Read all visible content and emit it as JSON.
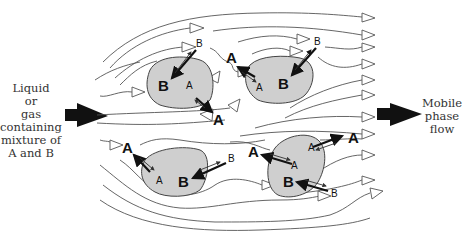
{
  "diagram": {
    "input_label": [
      "Liquid",
      "or",
      "gas",
      "containing",
      "mixture of",
      "A and B"
    ],
    "output_label": [
      "Mobile",
      "phase",
      "flow"
    ],
    "particles": [
      {
        "id": "top-left",
        "large_label": "B",
        "small_label": "A",
        "outside": [
          {
            "label": "B",
            "size": "small"
          },
          {
            "label": "A",
            "size": "large"
          }
        ]
      },
      {
        "id": "top-right",
        "large_label": "B",
        "small_label": "A",
        "outside": [
          {
            "label": "B",
            "size": "small"
          },
          {
            "label": "A",
            "size": "large"
          }
        ]
      },
      {
        "id": "bottom-left",
        "large_label": "B",
        "small_label": "A",
        "outside": [
          {
            "label": "A",
            "size": "large"
          },
          {
            "label": "B",
            "size": "small"
          }
        ]
      },
      {
        "id": "bottom-right",
        "large_label": "B",
        "small_label": "A",
        "outside": [
          {
            "label": "A",
            "size": "large"
          },
          {
            "label": "A",
            "size": "large"
          },
          {
            "label": "B",
            "size": "small"
          }
        ]
      }
    ],
    "labels": {
      "tl_B_small": "B",
      "tl_B_big": "B",
      "tl_A_small": "A",
      "tl_A_big": "A",
      "tl_A_free": "A",
      "tr_B_small": "B",
      "tr_B_big": "B",
      "tr_A_small": "A",
      "tr_A_big": "A",
      "bl_A_big": "A",
      "bl_A_small": "A",
      "bl_B_big": "B",
      "bl_B_small": "B",
      "br_A_big1": "A",
      "br_A_small1": "A",
      "br_A_big2": "A",
      "br_A_small2": "A",
      "br_B_big": "B",
      "br_B_small": "B"
    },
    "colors": {
      "particle_fill": "#cfcfcf",
      "arrow": "#111111",
      "streamline": "#555555",
      "text": "#333333"
    }
  }
}
